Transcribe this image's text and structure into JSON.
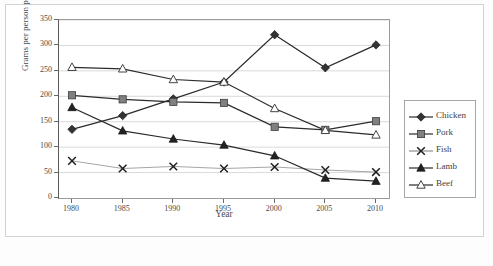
{
  "chart_data": {
    "type": "line",
    "title": "",
    "xlabel": "Year",
    "ylabel": "Grams per person per week",
    "categories": [
      1980,
      1985,
      1990,
      1995,
      2000,
      2005,
      2010
    ],
    "xtick_labels": [
      "1980",
      "1985",
      "1990",
      "1995",
      "2000",
      "2005",
      "2010"
    ],
    "ytick_labels": [
      "0",
      "50",
      "100",
      "150",
      "200",
      "250",
      "300",
      "350"
    ],
    "yticks": [
      0,
      50,
      100,
      150,
      200,
      250,
      300,
      350
    ],
    "ylim": [
      0,
      350
    ],
    "grid": "horizontal",
    "legend_position": "right",
    "series": [
      {
        "name": "Chicken",
        "marker": "filled-diamond",
        "color": "#333333",
        "values": [
          135,
          162,
          195,
          228,
          321,
          256,
          301
        ]
      },
      {
        "name": "Pork",
        "marker": "filled-square",
        "color": "#808080",
        "values": [
          202,
          194,
          189,
          187,
          140,
          134,
          151
        ]
      },
      {
        "name": "Fish",
        "marker": "cross-x",
        "color": "#8a8a8a",
        "values": [
          73,
          58,
          62,
          58,
          61,
          55,
          51
        ]
      },
      {
        "name": "Lamb",
        "marker": "filled-triangle",
        "color": "#222222",
        "values": [
          178,
          132,
          116,
          104,
          83,
          39,
          33
        ]
      },
      {
        "name": "Beef",
        "marker": "open-triangle",
        "color": "#444444",
        "values": [
          257,
          254,
          233,
          228,
          176,
          133,
          124
        ]
      }
    ]
  },
  "legend": {
    "entries": [
      "Chicken",
      "Pork",
      "Fish",
      "Lamb",
      "Beef"
    ]
  },
  "caption": {
    "text": ""
  }
}
